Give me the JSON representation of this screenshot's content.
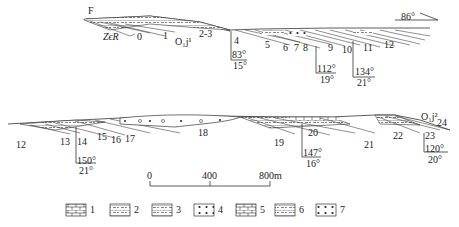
{
  "diagram": {
    "type": "geological cross-section",
    "fault_label": "F",
    "top_section": {
      "strata_labels": [
        "ZϵR",
        "0",
        "1",
        "O₁j¹",
        "2-3",
        "4",
        "5",
        "6",
        "7",
        "8",
        "9",
        "10",
        "11",
        "12"
      ],
      "attitudes": [
        {
          "strike": "83°",
          "dip": "15°"
        },
        {
          "strike": "112°",
          "dip": "19°"
        },
        {
          "strike": "134°",
          "dip": "21°"
        }
      ],
      "direction": "86°"
    },
    "bottom_section": {
      "strata_labels": [
        "12",
        "13",
        "14",
        "15",
        "16",
        "17",
        "18",
        "19",
        "20",
        "21",
        "22",
        "23",
        "24",
        "O₁j²"
      ],
      "attitudes": [
        {
          "strike": "150°",
          "dip": "21°"
        },
        {
          "strike": "147°",
          "dip": "16°"
        },
        {
          "strike": "120°",
          "dip": "20°"
        }
      ]
    },
    "scale_bar": {
      "ticks": [
        "0",
        "400",
        "800m"
      ]
    },
    "legend": [
      {
        "num": "1",
        "pattern": "brick-limestone-thick"
      },
      {
        "num": "2",
        "pattern": "argillaceous-dolomite"
      },
      {
        "num": "3",
        "pattern": "siliceous-dolomite"
      },
      {
        "num": "4",
        "pattern": "oolitic-dots"
      },
      {
        "num": "5",
        "pattern": "limestone"
      },
      {
        "num": "6",
        "pattern": "argillaceous-limestone"
      },
      {
        "num": "7",
        "pattern": "dotted-limestone"
      }
    ]
  }
}
